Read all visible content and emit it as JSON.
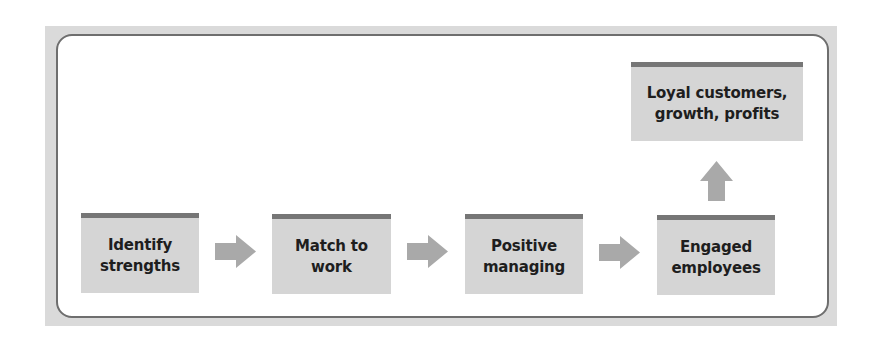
{
  "diagram": {
    "type": "flow",
    "colors": {
      "frame_band": "#dadada",
      "frame_border": "#6e6e6e",
      "box_fill": "#d5d5d5",
      "box_topbar": "#767676",
      "arrow": "#a9a9a9",
      "text": "#1e1e1e"
    },
    "steps": [
      {
        "id": "step1",
        "label": "Identify\nstrengths"
      },
      {
        "id": "step2",
        "label": "Match to\nwork"
      },
      {
        "id": "step3",
        "label": "Positive\nmanaging"
      },
      {
        "id": "step4",
        "label": "Engaged\nemployees"
      }
    ],
    "outcome": {
      "id": "outcome",
      "label": "Loyal customers,\ngrowth, profits"
    },
    "arrows": [
      {
        "from": "step1",
        "to": "step2",
        "direction": "right"
      },
      {
        "from": "step2",
        "to": "step3",
        "direction": "right"
      },
      {
        "from": "step3",
        "to": "step4",
        "direction": "right"
      },
      {
        "from": "step4",
        "to": "outcome",
        "direction": "up"
      }
    ]
  }
}
